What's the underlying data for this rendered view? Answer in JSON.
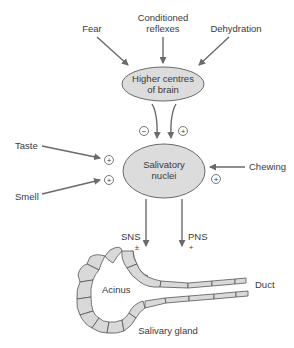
{
  "diagram": {
    "inputs_top": {
      "fear": "Fear",
      "conditioned_line1": "Conditioned",
      "conditioned_line2": "reflexes",
      "dehydration": "Dehydration"
    },
    "higher_centres": {
      "line1": "Higher centres",
      "line2": "of brain"
    },
    "higher_to_nuclei_signs": {
      "left": "−",
      "right": "+"
    },
    "inputs_side": {
      "taste": "Taste",
      "smell": "Smell",
      "chewing": "Chewing",
      "taste_sign": "+",
      "smell_sign": "+",
      "chewing_sign": "+"
    },
    "salivatory_nuclei": {
      "line1": "Salivatory",
      "line2": "nuclei"
    },
    "outputs": {
      "sns": "SNS",
      "sns_sign": "±",
      "pns": "PNS",
      "pns_sign": "+"
    },
    "gland": {
      "acinus": "Acinus",
      "duct": "Duct",
      "caption": "Salivary gland"
    },
    "colors": {
      "node_fill": "#dcdcdc",
      "arrow": "#6a6a6a",
      "cell_fill": "#d9d9d9"
    }
  }
}
